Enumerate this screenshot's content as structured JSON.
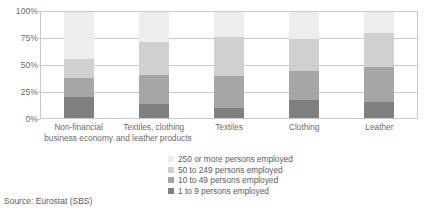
{
  "chart_data": {
    "type": "bar",
    "stacked": true,
    "normalized_percent": true,
    "title": "",
    "subtitle": "",
    "xlabel": "",
    "ylabel": "",
    "ylim": [
      0,
      100
    ],
    "yticks": [
      "0%",
      "25%",
      "50%",
      "75%",
      "100%"
    ],
    "ytick_values": [
      0,
      25,
      50,
      75,
      100
    ],
    "grid": true,
    "legend_position": "bottom",
    "categories": [
      "Non-financial business economy",
      "Textiles, clothing and leather products",
      "Textiles",
      "Clothing",
      "Leather"
    ],
    "category_lines": [
      [
        "Non-financial",
        "business economy"
      ],
      [
        "Textiles, clothing",
        "and leather products"
      ],
      [
        "Textiles"
      ],
      [
        "Clothing"
      ],
      [
        "Leather"
      ]
    ],
    "series": [
      {
        "name": "1 to 9 persons employed",
        "color": "#7f7f7f",
        "values": [
          20,
          13,
          9,
          17,
          15
        ]
      },
      {
        "name": "10 to 49 persons employed",
        "color": "#a6a6a6",
        "values": [
          18,
          28,
          31,
          27,
          33
        ]
      },
      {
        "name": "50 to 249 persons employed",
        "color": "#d0d0d0",
        "values": [
          18,
          31,
          36,
          31,
          32
        ]
      },
      {
        "name": "250 or more persons employed",
        "color": "#ededed",
        "values": [
          44,
          28,
          24,
          25,
          20
        ]
      }
    ],
    "legend_order_top_to_bottom": [
      "250 or more persons employed",
      "50 to 249 persons employed",
      "10 to 49 persons employed",
      "1 to 9 persons employed"
    ]
  },
  "legend": {
    "items": [
      {
        "label": "250 or more persons employed",
        "color": "#ededed"
      },
      {
        "label": "50 to 249 persons employed",
        "color": "#d0d0d0"
      },
      {
        "label": "10 to 49 persons employed",
        "color": "#a6a6a6"
      },
      {
        "label": "1 to 9 persons employed",
        "color": "#7f7f7f"
      }
    ]
  },
  "footer": {
    "source": "Source: Eurostat (SBS)"
  },
  "colors": {
    "grid": "#c9c9c9",
    "text": "#5b5b5b",
    "background": "#ffffff"
  }
}
